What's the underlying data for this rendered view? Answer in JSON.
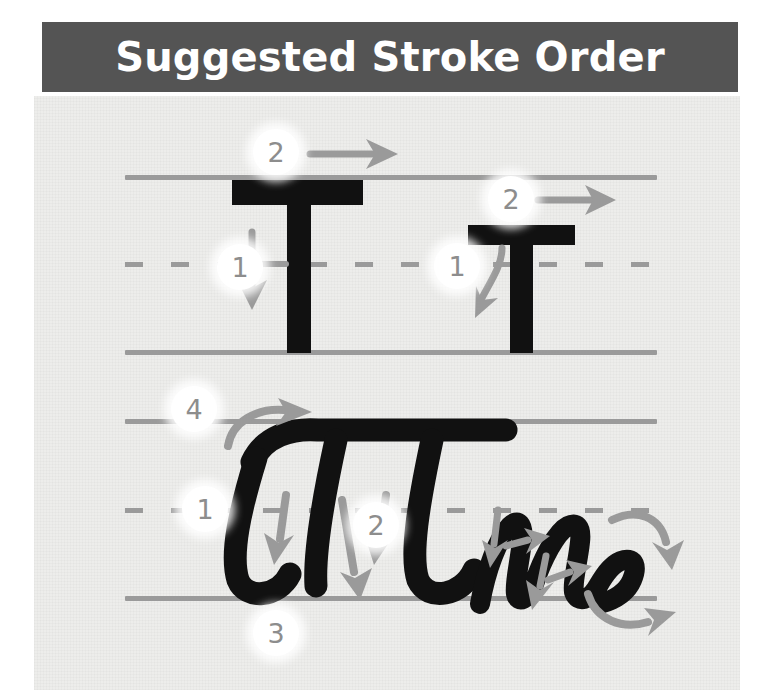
{
  "header": {
    "title": "Suggested Stroke Order",
    "background_color": "#545454",
    "text_color": "#ffffff"
  },
  "worksheet": {
    "background_color": "#ededeb",
    "guide_line_color": "#9a9a9a",
    "letter_color": "#111111",
    "arrow_color": "#9a9a9a",
    "badge_background": "#ffffff",
    "badge_text_color": "#8d8d8d"
  },
  "rows": [
    {
      "name": "print-row",
      "style": "print",
      "top_line": {
        "label": "top-line",
        "type": "solid"
      },
      "mid_line": {
        "label": "mid-line",
        "type": "dashed"
      },
      "base_line": {
        "label": "base-line",
        "type": "solid"
      },
      "letters": [
        {
          "name": "uppercase-t-print",
          "character": "T",
          "case": "uppercase",
          "strokes": [
            {
              "number": "1",
              "direction": "down",
              "description": "vertical stem downward"
            },
            {
              "number": "2",
              "direction": "right",
              "description": "horizontal crossbar left to right"
            }
          ]
        },
        {
          "name": "lowercase-t-print",
          "character": "t",
          "case": "lowercase",
          "strokes": [
            {
              "number": "1",
              "direction": "down",
              "description": "vertical stem downward"
            },
            {
              "number": "2",
              "direction": "right",
              "description": "horizontal crossbar left to right"
            }
          ]
        }
      ]
    },
    {
      "name": "cursive-row",
      "style": "cursive",
      "top_line": {
        "label": "top-line",
        "type": "solid"
      },
      "mid_line": {
        "label": "mid-line",
        "type": "dashed"
      },
      "base_line": {
        "label": "base-line",
        "type": "solid"
      },
      "letters": [
        {
          "name": "uppercase-t-cursive",
          "character": "T",
          "case": "uppercase",
          "strokes": [
            {
              "number": "1",
              "direction": "down",
              "description": "first downstroke"
            },
            {
              "number": "2",
              "direction": "down",
              "description": "third downstroke"
            },
            {
              "number": "3",
              "direction": "down",
              "description": "second downstroke to baseline"
            },
            {
              "number": "4",
              "direction": "right",
              "description": "entry curve into top"
            }
          ]
        },
        {
          "name": "lowercase-m-cursive",
          "character": "m",
          "case": "lowercase",
          "strokes": [
            {
              "number": "",
              "direction": "down",
              "description": "entry downstroke"
            },
            {
              "number": "",
              "direction": "right",
              "description": "first hump over"
            },
            {
              "number": "",
              "direction": "down",
              "description": "second downstroke"
            },
            {
              "number": "",
              "direction": "right",
              "description": "exit stroke"
            }
          ]
        }
      ]
    }
  ],
  "badges": [
    {
      "name": "badge-print-upper-t-1",
      "text": "1"
    },
    {
      "name": "badge-print-upper-t-2",
      "text": "2"
    },
    {
      "name": "badge-print-lower-t-1",
      "text": "1"
    },
    {
      "name": "badge-print-lower-t-2",
      "text": "2"
    },
    {
      "name": "badge-cursive-upper-t-1",
      "text": "1"
    },
    {
      "name": "badge-cursive-upper-t-2",
      "text": "2"
    },
    {
      "name": "badge-cursive-upper-t-3",
      "text": "3"
    },
    {
      "name": "badge-cursive-upper-t-4",
      "text": "4"
    }
  ]
}
